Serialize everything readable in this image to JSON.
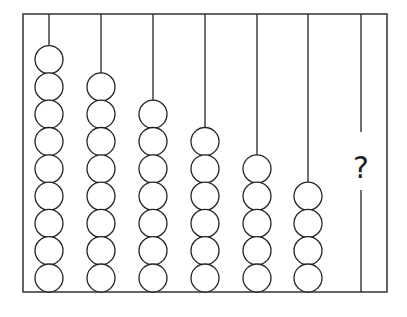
{
  "diagram": {
    "type": "abacus-pattern-puzzle",
    "frame": {
      "left": 23,
      "top": 14,
      "right": 387,
      "bottom": 292
    },
    "bead_radius": 14,
    "bead_spacing": 27.3,
    "colors": {
      "stroke": "#222222",
      "bead_fill": "#ffffff",
      "background": "#ffffff"
    },
    "rods": [
      {
        "x": 49,
        "beads": 9
      },
      {
        "x": 101,
        "beads": 8
      },
      {
        "x": 153,
        "beads": 7
      },
      {
        "x": 205,
        "beads": 6
      },
      {
        "x": 257,
        "beads": 5
      },
      {
        "x": 308,
        "beads": 4
      },
      {
        "x": 361,
        "beads": null,
        "label": "?"
      }
    ]
  }
}
